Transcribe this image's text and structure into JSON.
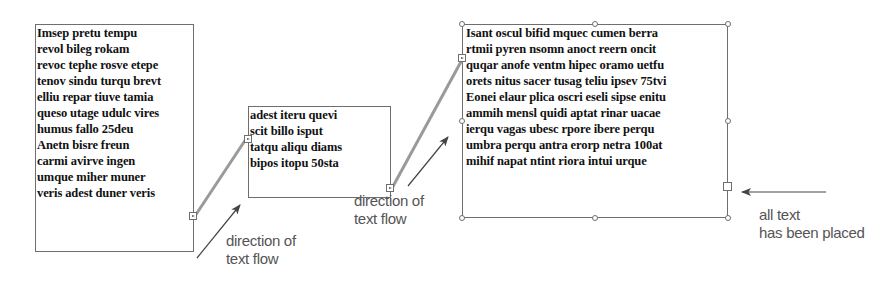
{
  "frames": [
    {
      "lines": [
        "Imsep pretu tempu",
        "revol bileg rokam",
        "revoc tephe rosve etepe",
        "tenov sindu turqu brevt",
        "elliu repar tiuve tamia",
        "queso utage udulc vires",
        "humus fallo 25deu",
        "Anetn bisre freun",
        "carmi avirve ingen",
        "umque miher muner",
        "veris adest duner veris"
      ]
    },
    {
      "lines": [
        "adest iteru quevi",
        "scit billo isput",
        "tatqu aliqu diams",
        "bipos itopu 50sta"
      ]
    },
    {
      "lines": [
        "Isant oscul bifid mquec cumen berra",
        "rtmii pyren nsomn anoct reern oncit",
        "quqar anofe ventm hipec oramo uetfu",
        "orets nitus sacer tusag teliu ipsev 75tvi",
        "Eonei elaur plica oscri eseli sipse enitu",
        "ammih mensl quidi aptat rinar uacae",
        "ierqu vagas ubesc rpore ibere perqu",
        "umbra perqu antra erorp netra 100at",
        "mihif napat ntint riora intui urque"
      ]
    }
  ],
  "captions": {
    "flow1": [
      "direction of",
      "text flow"
    ],
    "flow2": [
      "direction of",
      "text flow"
    ],
    "placed": [
      "all text",
      "has been placed"
    ]
  },
  "colors": {
    "frame_border": "#6e6e6e",
    "thread_line": "#9a9a9a",
    "arrow": "#444444",
    "caption_text": "#555555"
  }
}
